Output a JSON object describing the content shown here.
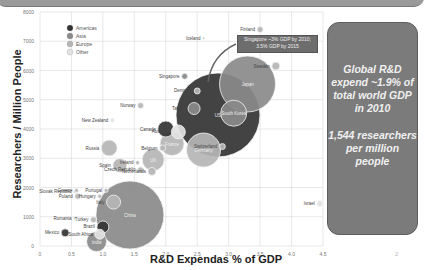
{
  "banner": {
    "color": "#9a9a9a"
  },
  "chart_data": {
    "type": "scatter",
    "subtype": "bubble",
    "xlabel": "R&D Expendas % of GDP",
    "ylabel": "Researchers / Million People",
    "xlim": [
      0,
      4.5
    ],
    "ylim": [
      0,
      8000
    ],
    "xticks": [
      "0",
      "0.5",
      "1.0",
      "1.5",
      "2.0",
      "2.5",
      "3.0",
      "3.5",
      "4.0",
      "4.5"
    ],
    "yticks": [
      "0",
      "1000",
      "2000",
      "3000",
      "4000",
      "5000",
      "6000",
      "7000",
      "8000"
    ],
    "grid": true,
    "legend": {
      "position": "upper-left",
      "entries": [
        {
          "label": "Americas",
          "color": "#333333"
        },
        {
          "label": "Asia",
          "color": "#8a8a8a"
        },
        {
          "label": "Europe",
          "color": "#b5b5b5"
        },
        {
          "label": "Other",
          "color": "#e2e2e2"
        }
      ]
    },
    "points": [
      {
        "name": "United States",
        "label": "US",
        "x": 2.83,
        "y": 4480,
        "r": 42,
        "region": "Americas"
      },
      {
        "name": "Japan",
        "label": "Japan",
        "x": 3.3,
        "y": 5540,
        "r": 28,
        "region": "Asia"
      },
      {
        "name": "China",
        "label": "China",
        "x": 1.43,
        "y": 1060,
        "r": 34,
        "region": "Asia"
      },
      {
        "name": "South Korea",
        "label": "South Korea",
        "x": 3.08,
        "y": 4540,
        "r": 13,
        "region": "Asia"
      },
      {
        "name": "Germany",
        "label": "Germany",
        "x": 2.6,
        "y": 3280,
        "r": 17,
        "region": "Europe"
      },
      {
        "name": "France",
        "label": "France",
        "x": 2.1,
        "y": 3500,
        "r": 12,
        "region": "Europe"
      },
      {
        "name": "UK",
        "label": "UK",
        "x": 1.8,
        "y": 2950,
        "r": 11,
        "region": "Europe"
      },
      {
        "name": "Russia",
        "label": "Russia",
        "x": 1.1,
        "y": 3350,
        "r": 8,
        "region": "Europe"
      },
      {
        "name": "Canada",
        "label": "Canada",
        "x": 2.0,
        "y": 4000,
        "r": 8,
        "region": "Americas"
      },
      {
        "name": "Taiwan",
        "label": "Taiwan",
        "x": 2.45,
        "y": 4700,
        "r": 6,
        "region": "Asia"
      },
      {
        "name": "Australia",
        "label": "Australia",
        "x": 2.2,
        "y": 3900,
        "r": 7,
        "region": "Other"
      },
      {
        "name": "Switzerland",
        "label": "Switzerland",
        "x": 2.9,
        "y": 3400,
        "r": 3,
        "region": "Europe"
      },
      {
        "name": "Italy",
        "label": "Italy",
        "x": 1.17,
        "y": 1500,
        "r": 7,
        "region": "Europe"
      },
      {
        "name": "Spain",
        "label": "Spain",
        "x": 1.27,
        "y": 2750,
        "r": 7,
        "region": "Europe"
      },
      {
        "name": "Netherlands",
        "label": "Netherlands",
        "x": 1.78,
        "y": 2550,
        "r": 4,
        "region": "Europe"
      },
      {
        "name": "Czech Republic",
        "label": "Czech Republic",
        "x": 1.6,
        "y": 2600,
        "r": 3,
        "region": "Europe"
      },
      {
        "name": "Belgium",
        "label": "Belgium",
        "x": 1.95,
        "y": 3350,
        "r": 3,
        "region": "Europe"
      },
      {
        "name": "Ireland",
        "label": "Ireland",
        "x": 1.55,
        "y": 2850,
        "r": 2,
        "region": "Europe"
      },
      {
        "name": "Singapore",
        "label": "Singapore",
        "x": 2.3,
        "y": 5800,
        "r": 3,
        "region": "Asia"
      },
      {
        "name": "Denmark",
        "label": "Denmark",
        "x": 2.5,
        "y": 5300,
        "r": 3,
        "region": "Europe"
      },
      {
        "name": "Norway",
        "label": "Norway",
        "x": 1.6,
        "y": 4800,
        "r": 3,
        "region": "Europe"
      },
      {
        "name": "New Zealand",
        "label": "New Zealand",
        "x": 1.15,
        "y": 4300,
        "r": 2,
        "region": "Other"
      },
      {
        "name": "Iceland",
        "label": "Iceland",
        "x": 2.6,
        "y": 7100,
        "r": 1,
        "region": "Europe"
      },
      {
        "name": "Finland",
        "label": "Finland",
        "x": 3.5,
        "y": 7400,
        "r": 3,
        "region": "Europe"
      },
      {
        "name": "Sweden",
        "label": "Sweden",
        "x": 3.75,
        "y": 6150,
        "r": 4,
        "region": "Europe"
      },
      {
        "name": "Israel",
        "label": "Israel",
        "x": 4.45,
        "y": 1450,
        "r": 3,
        "region": "Other"
      },
      {
        "name": "Portugal",
        "label": "Portugal",
        "x": 1.05,
        "y": 1900,
        "r": 2,
        "region": "Europe"
      },
      {
        "name": "Slovak Republic",
        "label": "Slovak Republic",
        "x": 0.55,
        "y": 1850,
        "r": 1,
        "region": "Europe"
      },
      {
        "name": "Greece",
        "label": "Greece",
        "x": 0.58,
        "y": 1900,
        "r": 2,
        "region": "Europe"
      },
      {
        "name": "Hungary",
        "label": "Hungary",
        "x": 0.95,
        "y": 1700,
        "r": 2,
        "region": "Europe"
      },
      {
        "name": "Poland",
        "label": "Poland",
        "x": 0.6,
        "y": 1700,
        "r": 3,
        "region": "Europe"
      },
      {
        "name": "Romania",
        "label": "Romania",
        "x": 0.55,
        "y": 950,
        "r": 1,
        "region": "Europe"
      },
      {
        "name": "Turkey",
        "label": "Turkey",
        "x": 0.85,
        "y": 900,
        "r": 3,
        "region": "Europe"
      },
      {
        "name": "Brazil",
        "label": "Brazil",
        "x": 1.0,
        "y": 650,
        "r": 6,
        "region": "Americas"
      },
      {
        "name": "Mexico",
        "label": "Mexico",
        "x": 0.4,
        "y": 450,
        "r": 4,
        "region": "Americas"
      },
      {
        "name": "South Africa",
        "label": "South Africa",
        "x": 0.95,
        "y": 400,
        "r": 5,
        "region": "Other"
      },
      {
        "name": "India",
        "label": "India",
        "x": 0.9,
        "y": 150,
        "r": 10,
        "region": "Asia"
      }
    ],
    "annotations": [
      {
        "text": "Singapore ~3% GDP by 2010; 3.5% GDP by 2015",
        "target": "Singapore"
      }
    ]
  },
  "callout": {
    "line1": "Singapore ~3% GDP by 2010;",
    "line2": "3.5% GDP by 2015"
  },
  "panel": {
    "text1": "Global R&D expend ~1.9% of total world GDP in 2010",
    "text2": "1,544 researchers per million people"
  },
  "page_number": "2"
}
